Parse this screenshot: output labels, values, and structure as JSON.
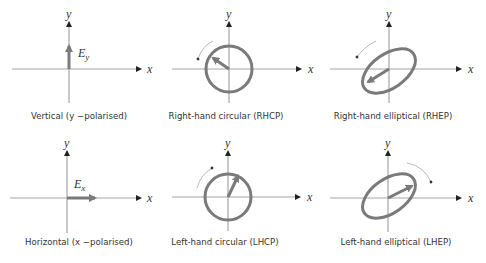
{
  "colors": {
    "axis": "#a6a6a6",
    "vector": "#7a7a7a",
    "arrowhead": "#222222",
    "text": "#333333",
    "background": "#ffffff"
  },
  "axis_labels": {
    "x": "x",
    "y": "y"
  },
  "panels": [
    {
      "id": "vertical",
      "caption": "Vertical (y −polarised)",
      "vector_label_main": "E",
      "vector_label_sub": "y",
      "shape": "linear-vertical"
    },
    {
      "id": "rhcp",
      "caption": "Right-hand circular (RHCP)",
      "shape": "circle",
      "rotation": "counter-clockwise"
    },
    {
      "id": "rhep",
      "caption": "Right-hand elliptical (RHEP)",
      "shape": "ellipse",
      "rotation": "counter-clockwise"
    },
    {
      "id": "horizontal",
      "caption": "Horizontal (x −polarised)",
      "vector_label_main": "E",
      "vector_label_sub": "x",
      "shape": "linear-horizontal"
    },
    {
      "id": "lhcp",
      "caption": "Left-hand circular (LHCP)",
      "shape": "circle",
      "rotation": "clockwise"
    },
    {
      "id": "lhep",
      "caption": "Left-hand elliptical (LHEP)",
      "shape": "ellipse",
      "rotation": "clockwise"
    }
  ]
}
